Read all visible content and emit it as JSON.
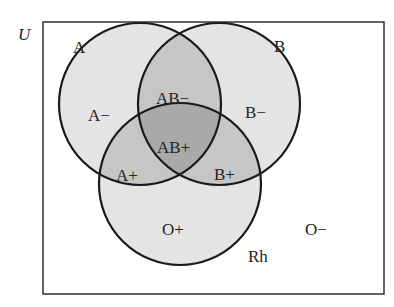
{
  "universe": {
    "label": "U"
  },
  "sets": {
    "a": {
      "label": "A"
    },
    "b": {
      "label": "B"
    },
    "rh": {
      "label": "Rh"
    }
  },
  "regions": {
    "a_neg": "A−",
    "b_neg": "B−",
    "ab_neg": "AB−",
    "ab_pos": "AB+",
    "a_pos": "A+",
    "b_pos": "B+",
    "o_pos": "O+",
    "o_neg": "O−"
  },
  "colors": {
    "one_set": "#e4e4e4",
    "two_sets": "#c6c6c6",
    "three_sets": "#a9a9a9",
    "stroke": "#1a1a1a"
  }
}
